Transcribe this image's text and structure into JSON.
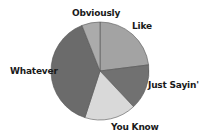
{
  "chart_data": {
    "type": "pie",
    "title": "",
    "categories": [
      "Like",
      "Just Sayin'",
      "You Know",
      "Whatever",
      "Obviously"
    ],
    "values": [
      23,
      15,
      17,
      39,
      6
    ],
    "unit": "percent (estimated)",
    "start_angle": "12 o'clock, clockwise",
    "colors": [
      "#a3a3a3",
      "#717171",
      "#d9d9d9",
      "#6b6b6b",
      "#ababab"
    ],
    "legend": "none (labels placed outside slices)",
    "labels": {
      "like": "Like",
      "just_sayin": "Just Sayin'",
      "you_know": "You Know",
      "whatever": "Whatever",
      "obviously": "Obviously"
    }
  }
}
